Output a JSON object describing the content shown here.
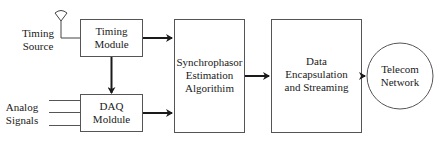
{
  "diagram": {
    "colors": {
      "line": "#2a2a2a",
      "box_border": "#555555",
      "background": "#ffffff"
    },
    "inputs": {
      "timing_source": {
        "lines": [
          "Timing",
          "Source"
        ],
        "icon": "antenna-icon"
      },
      "analog_signals": {
        "lines": [
          "Analog",
          "Signals"
        ],
        "line_count": 3
      }
    },
    "blocks": {
      "timing_module": {
        "lines": [
          "Timing",
          "Module"
        ]
      },
      "daq_module": {
        "lines": [
          "DAQ",
          "Moldule"
        ]
      },
      "synchrophasor": {
        "lines": [
          "Synchrophasor",
          "Estimation",
          "Algorithim"
        ]
      },
      "data_encapsulation": {
        "lines": [
          "Data",
          "Encapsulation",
          "and Streaming"
        ]
      },
      "telecom_network": {
        "lines": [
          "Telecom",
          "Network"
        ],
        "shape": "circle"
      }
    },
    "connections": [
      {
        "from": "timing_source",
        "to": "timing_module"
      },
      {
        "from": "timing_module",
        "to": "daq_module"
      },
      {
        "from": "analog_signals",
        "to": "daq_module"
      },
      {
        "from": "timing_module",
        "to": "synchrophasor"
      },
      {
        "from": "daq_module",
        "to": "synchrophasor"
      },
      {
        "from": "synchrophasor",
        "to": "data_encapsulation"
      },
      {
        "from": "data_encapsulation",
        "to": "telecom_network"
      }
    ]
  }
}
